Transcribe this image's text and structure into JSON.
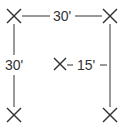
{
  "diagram": {
    "type": "spacing-layout",
    "markers": [
      {
        "name": "top-left",
        "x": 14,
        "y": 16
      },
      {
        "name": "top-right",
        "x": 110,
        "y": 16
      },
      {
        "name": "bottom-left",
        "x": 14,
        "y": 115
      },
      {
        "name": "bottom-right",
        "x": 110,
        "y": 115
      },
      {
        "name": "center",
        "x": 60,
        "y": 64
      }
    ],
    "dimensions": {
      "top": "30'",
      "left": "30'",
      "center_to_right": "15'"
    },
    "colors": {
      "line": "#555555",
      "marker": "#333333",
      "text": "#333333",
      "background": "#ffffff"
    }
  }
}
